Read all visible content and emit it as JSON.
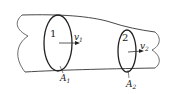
{
  "diagram": {
    "section1": {
      "number": "1",
      "velocity": "v",
      "velocity_sub": "1",
      "area": "A",
      "area_sub": "1"
    },
    "section2": {
      "number": "2",
      "velocity": "v",
      "velocity_sub": "2",
      "area": "A",
      "area_sub": "2"
    },
    "colors": {
      "stroke": "#222222",
      "background": "#ffffff"
    }
  }
}
